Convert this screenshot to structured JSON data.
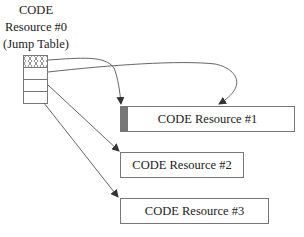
{
  "jump_table": {
    "title_lines": [
      "CODE",
      "Resource #0",
      "(Jump Table)"
    ],
    "rows": 4
  },
  "resources": [
    {
      "label": "CODE Resource #1"
    },
    {
      "label": "CODE Resource #2"
    },
    {
      "label": "CODE Resource #3"
    }
  ],
  "colors": {
    "stroke": "#777777",
    "strip": "#777777"
  }
}
